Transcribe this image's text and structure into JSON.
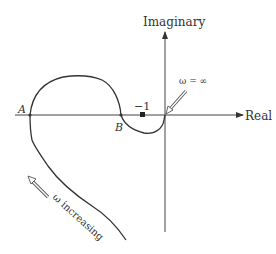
{
  "diagram": {
    "axes": {
      "real_label": "Real",
      "imaginary_label": "Imaginary"
    },
    "points": {
      "a_label": "A",
      "b_label": "B",
      "minus_one_label": "−1"
    },
    "annotations": {
      "omega_infinity": "ω = ∞",
      "omega_increasing": "ω increasing"
    },
    "colors": {
      "curve": "#333333",
      "axis": "#444444",
      "background": "#ffffff"
    }
  }
}
